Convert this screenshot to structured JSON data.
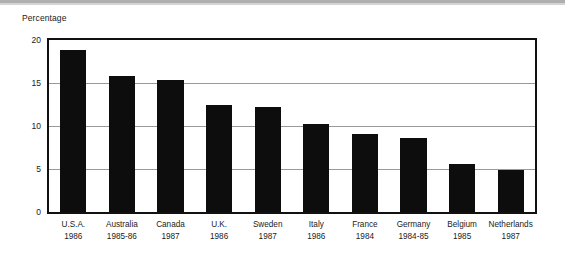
{
  "chart_data": {
    "type": "bar",
    "title": "",
    "subtitle": "",
    "xlabel": "",
    "ylabel": "Percentage",
    "ylim": [
      0,
      20
    ],
    "yticks": [
      0,
      5,
      10,
      15,
      20
    ],
    "ytick_labels": [
      "0",
      "5",
      "10",
      "15",
      "20"
    ],
    "grid": true,
    "grid_axis": "y",
    "legend": false,
    "orientation": "vertical",
    "bar_color": "#0d0d0d",
    "categories": [
      "U.S.A.",
      "Australia",
      "Canada",
      "U.K.",
      "Sweden",
      "Italy",
      "France",
      "Germany",
      "Belgium",
      "Netherlands"
    ],
    "category_years": [
      "1986",
      "1985-86",
      "1987",
      "1986",
      "1987",
      "1986",
      "1984",
      "1984-85",
      "1985",
      "1987"
    ],
    "values": [
      18.8,
      15.8,
      15.4,
      12.5,
      12.2,
      10.2,
      9.1,
      8.6,
      5.6,
      4.9
    ],
    "points": [
      {
        "country": "U.S.A.",
        "year": "1986",
        "value": 18.8
      },
      {
        "country": "Australia",
        "year": "1985-86",
        "value": 15.8
      },
      {
        "country": "Canada",
        "year": "1987",
        "value": 15.4
      },
      {
        "country": "U.K.",
        "year": "1986",
        "value": 12.5
      },
      {
        "country": "Sweden",
        "year": "1987",
        "value": 12.2
      },
      {
        "country": "Italy",
        "year": "1986",
        "value": 10.2
      },
      {
        "country": "France",
        "year": "1984",
        "value": 9.1
      },
      {
        "country": "Germany",
        "year": "1984-85",
        "value": 8.6
      },
      {
        "country": "Belgium",
        "year": "1985",
        "value": 5.6
      },
      {
        "country": "Netherlands",
        "year": "1987",
        "value": 4.9
      }
    ]
  },
  "colors": {
    "bar": "#0d0d0d",
    "frame": "#111111",
    "gridline": "#9a9a9a",
    "text": "#1b1b1b",
    "background": "#ffffff"
  }
}
